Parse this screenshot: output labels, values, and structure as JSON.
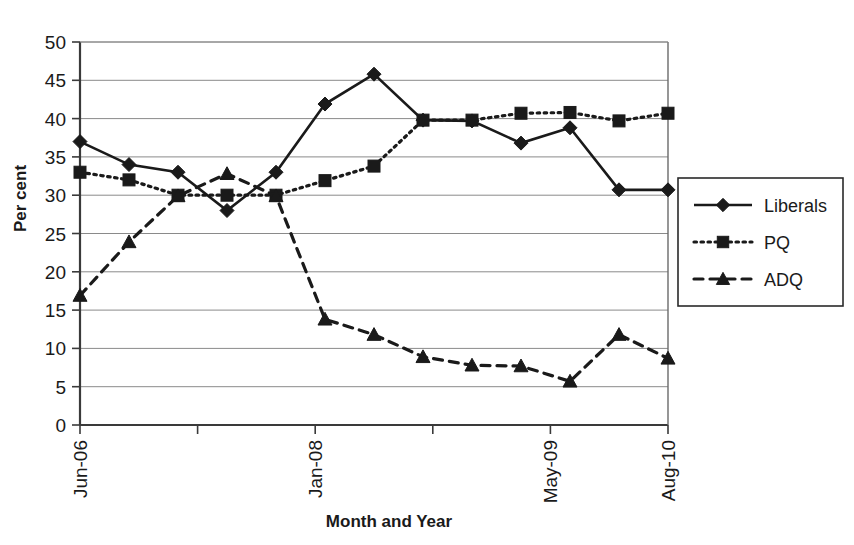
{
  "chart_data": {
    "type": "line",
    "title": "",
    "xlabel": "Month and Year",
    "ylabel": "Per cent",
    "ylim": [
      0,
      50
    ],
    "ytick_step": 5,
    "yticks": [
      0,
      5,
      10,
      15,
      20,
      25,
      30,
      35,
      40,
      45,
      50
    ],
    "grid": "horizontal",
    "legend_position": "right-outside",
    "x_indices": [
      0,
      1,
      2,
      3,
      4,
      5,
      6,
      7,
      8,
      9,
      10,
      11,
      12,
      13,
      14,
      15
    ],
    "x_tick_positions": [
      0,
      3,
      6,
      9,
      12,
      15
    ],
    "x_tick_labels": [
      "Jun-06",
      "",
      "Jan-08",
      "",
      "May-09",
      "Aug-10"
    ],
    "x_labeled_ticks": [
      {
        "index": 0,
        "label": "Jun-06"
      },
      {
        "index": 6,
        "label": "Jan-08"
      },
      {
        "index": 12,
        "label": "May-09"
      },
      {
        "index": 15,
        "label": "Aug-10"
      }
    ],
    "series": [
      {
        "name": "Liberals",
        "marker": "diamond",
        "dash": "solid",
        "color": "#1a1a1a",
        "values": [
          37.0,
          34.0,
          33.0,
          28.0,
          33.0,
          41.9,
          45.8,
          39.8,
          39.7,
          36.8,
          38.8,
          30.7,
          30.7
        ]
      },
      {
        "name": "PQ",
        "marker": "square",
        "dash": "dotted",
        "color": "#1a1a1a",
        "values": [
          33.0,
          32.0,
          30.0,
          30.0,
          30.0,
          31.9,
          33.8,
          39.8,
          39.8,
          40.7,
          40.8,
          39.7,
          40.7
        ]
      },
      {
        "name": "ADQ",
        "marker": "triangle",
        "dash": "dashed",
        "color": "#1a1a1a",
        "values": [
          16.9,
          23.9,
          29.9,
          32.8,
          29.9,
          13.8,
          11.8,
          8.9,
          7.8,
          7.7,
          5.7,
          11.8,
          8.7
        ]
      }
    ],
    "legend": [
      {
        "name": "Liberals",
        "marker": "diamond",
        "dash": "solid"
      },
      {
        "name": "PQ",
        "marker": "square",
        "dash": "dotted"
      },
      {
        "name": "ADQ",
        "marker": "triangle",
        "dash": "dashed"
      }
    ]
  }
}
